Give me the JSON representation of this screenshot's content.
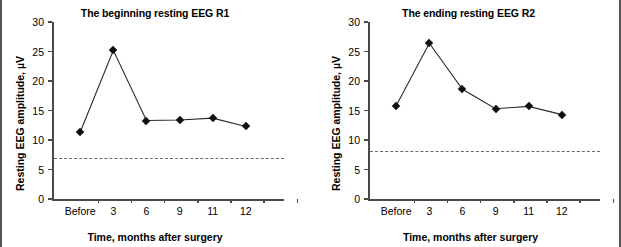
{
  "figure": {
    "background": "#ffffff",
    "axis_color": "#4a4a4a",
    "line_color": "#2a2a2a",
    "marker_color": "#111111",
    "refline_color": "#6a6a6a"
  },
  "chart_data": [
    {
      "type": "line",
      "title": "The beginning resting EEG R1",
      "xlabel": "Time, months after surgery",
      "ylabel": "Resting EEG amplitude, µV",
      "categories": [
        "Before",
        "3",
        "6",
        "9",
        "11",
        "12"
      ],
      "values": [
        11.3,
        25.2,
        13.3,
        13.4,
        13.7,
        12.3
      ],
      "yticks": [
        0,
        5,
        10,
        15,
        20,
        25,
        30
      ],
      "ytick_labels": [
        "0",
        "5",
        "10",
        "15",
        "20",
        "25",
        "30"
      ],
      "ylim": [
        0,
        30
      ],
      "grid": false,
      "legend": "none",
      "marker": "diamond",
      "reference_line": {
        "value": 7.0,
        "style": "dashed"
      }
    },
    {
      "type": "line",
      "title": "The ending resting EEG R2",
      "xlabel": "Time, months after surgery",
      "ylabel": "Resting EEG amplitude, µV",
      "categories": [
        "Before",
        "3",
        "6",
        "9",
        "11",
        "12"
      ],
      "values": [
        15.8,
        26.4,
        18.6,
        15.3,
        15.7,
        14.3
      ],
      "yticks": [
        0,
        5,
        10,
        15,
        20,
        25,
        30
      ],
      "ytick_labels": [
        "0",
        "5",
        "10",
        "15",
        "20",
        "25",
        "30"
      ],
      "ylim": [
        0,
        30
      ],
      "grid": false,
      "legend": "none",
      "marker": "diamond",
      "reference_line": {
        "value": 8.2,
        "style": "dashed"
      }
    }
  ]
}
